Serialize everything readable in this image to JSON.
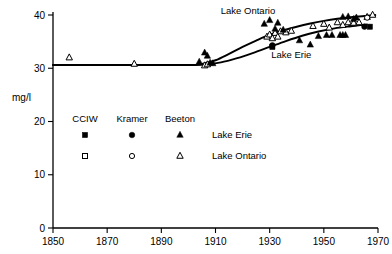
{
  "chart_data": {
    "type": "scatter",
    "title": "",
    "subtitle": "",
    "xlabel": "",
    "ylabel": "mg/l",
    "xlim": [
      1850,
      1970
    ],
    "ylim": [
      0,
      40
    ],
    "grid": false,
    "legend_position": "inside-lower-left",
    "x_ticks": [
      1850,
      1870,
      1890,
      1910,
      1930,
      1950,
      1970
    ],
    "y_ticks": [
      0,
      10,
      20,
      30,
      40
    ],
    "annotations": [
      {
        "text": "Lake Ontario",
        "x": 1922,
        "y": 40.2
      },
      {
        "text": "Lake Erie",
        "x": 1938,
        "y": 32.0
      }
    ],
    "legend": {
      "columns": [
        "CCIW",
        "Kramer",
        "Beeton"
      ],
      "rows": [
        {
          "label": "Lake Erie",
          "style": "filled",
          "markers": [
            "square",
            "circle",
            "triangle"
          ]
        },
        {
          "label": "Lake Ontario",
          "style": "open",
          "markers": [
            "square",
            "circle",
            "triangle"
          ]
        }
      ]
    },
    "series": [
      {
        "name": "Lake Ontario trend",
        "render": "line",
        "points": [
          {
            "x": 1850,
            "y": 30.6
          },
          {
            "x": 1880,
            "y": 30.6
          },
          {
            "x": 1900,
            "y": 30.6
          },
          {
            "x": 1905,
            "y": 30.8
          },
          {
            "x": 1910,
            "y": 31.5
          },
          {
            "x": 1915,
            "y": 32.7
          },
          {
            "x": 1920,
            "y": 34.0
          },
          {
            "x": 1925,
            "y": 35.2
          },
          {
            "x": 1930,
            "y": 36.3
          },
          {
            "x": 1935,
            "y": 37.1
          },
          {
            "x": 1940,
            "y": 37.8
          },
          {
            "x": 1945,
            "y": 38.4
          },
          {
            "x": 1950,
            "y": 38.9
          },
          {
            "x": 1955,
            "y": 39.3
          },
          {
            "x": 1960,
            "y": 39.6
          },
          {
            "x": 1965,
            "y": 39.8
          },
          {
            "x": 1969,
            "y": 40.0
          }
        ]
      },
      {
        "name": "Lake Erie trend",
        "render": "line",
        "points": [
          {
            "x": 1850,
            "y": 30.6
          },
          {
            "x": 1880,
            "y": 30.6
          },
          {
            "x": 1900,
            "y": 30.6
          },
          {
            "x": 1906,
            "y": 30.7
          },
          {
            "x": 1912,
            "y": 31.1
          },
          {
            "x": 1918,
            "y": 31.9
          },
          {
            "x": 1924,
            "y": 32.9
          },
          {
            "x": 1930,
            "y": 34.0
          },
          {
            "x": 1936,
            "y": 35.1
          },
          {
            "x": 1942,
            "y": 36.1
          },
          {
            "x": 1948,
            "y": 36.9
          },
          {
            "x": 1954,
            "y": 37.5
          },
          {
            "x": 1960,
            "y": 37.9
          },
          {
            "x": 1965,
            "y": 38.2
          }
        ]
      },
      {
        "name": "Lake Erie trend dashed tail",
        "render": "line-dashed",
        "points": [
          {
            "x": 1959,
            "y": 37.9
          },
          {
            "x": 1963,
            "y": 38.1
          },
          {
            "x": 1967,
            "y": 38.3
          }
        ]
      },
      {
        "name": "Beeton Lake Ontario",
        "marker": "triangle",
        "style": "open",
        "points": [
          {
            "x": 1856,
            "y": 32.0
          },
          {
            "x": 1880,
            "y": 30.8
          },
          {
            "x": 1906,
            "y": 30.5
          },
          {
            "x": 1907,
            "y": 30.7
          },
          {
            "x": 1929,
            "y": 35.9
          },
          {
            "x": 1930,
            "y": 36.3
          },
          {
            "x": 1931,
            "y": 35.6
          },
          {
            "x": 1932,
            "y": 36.6
          },
          {
            "x": 1933,
            "y": 35.9
          },
          {
            "x": 1934,
            "y": 36.9
          },
          {
            "x": 1936,
            "y": 36.7
          },
          {
            "x": 1938,
            "y": 37.0
          },
          {
            "x": 1946,
            "y": 37.9
          },
          {
            "x": 1950,
            "y": 38.3
          },
          {
            "x": 1952,
            "y": 37.6
          },
          {
            "x": 1955,
            "y": 38.6
          },
          {
            "x": 1957,
            "y": 38.1
          },
          {
            "x": 1959,
            "y": 38.6
          },
          {
            "x": 1961,
            "y": 38.5
          },
          {
            "x": 1963,
            "y": 38.6
          },
          {
            "x": 1966,
            "y": 39.6
          },
          {
            "x": 1968,
            "y": 40.0
          }
        ]
      },
      {
        "name": "Beeton Lake Erie",
        "marker": "triangle",
        "style": "filled",
        "points": [
          {
            "x": 1904,
            "y": 31.2
          },
          {
            "x": 1906,
            "y": 32.9
          },
          {
            "x": 1907,
            "y": 32.3
          },
          {
            "x": 1908,
            "y": 31.0
          },
          {
            "x": 1909,
            "y": 30.9
          },
          {
            "x": 1928,
            "y": 38.3
          },
          {
            "x": 1930,
            "y": 39.0
          },
          {
            "x": 1932,
            "y": 37.4
          },
          {
            "x": 1933,
            "y": 38.5
          },
          {
            "x": 1935,
            "y": 37.2
          },
          {
            "x": 1941,
            "y": 35.2
          },
          {
            "x": 1945,
            "y": 34.4
          },
          {
            "x": 1948,
            "y": 36.0
          },
          {
            "x": 1951,
            "y": 36.2
          },
          {
            "x": 1953,
            "y": 36.2
          },
          {
            "x": 1956,
            "y": 36.2
          },
          {
            "x": 1957,
            "y": 36.2
          },
          {
            "x": 1958,
            "y": 36.2
          },
          {
            "x": 1957,
            "y": 39.6
          },
          {
            "x": 1959,
            "y": 39.7
          },
          {
            "x": 1961,
            "y": 39.2
          },
          {
            "x": 1962,
            "y": 39.5
          }
        ]
      },
      {
        "name": "CCIW Lake Erie",
        "marker": "square",
        "style": "filled",
        "points": [
          {
            "x": 1931,
            "y": 34.0
          },
          {
            "x": 1967,
            "y": 37.8
          }
        ]
      },
      {
        "name": "Kramer Lake Erie",
        "marker": "circle",
        "style": "filled",
        "points": [
          {
            "x": 1931,
            "y": 34.3
          },
          {
            "x": 1965,
            "y": 37.8
          }
        ]
      },
      {
        "name": "Kramer Lake Ontario",
        "marker": "circle",
        "style": "open",
        "points": [
          {
            "x": 1966,
            "y": 39.5
          }
        ]
      },
      {
        "name": "CCIW Lake Ontario",
        "marker": "square",
        "style": "open",
        "points": []
      }
    ]
  }
}
